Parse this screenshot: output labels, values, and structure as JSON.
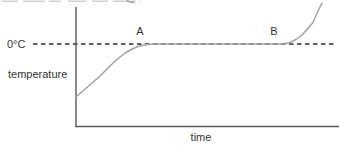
{
  "figure": {
    "labels": {
      "zero_celsius": "0°C",
      "y_axis": "temperature",
      "x_axis": "time"
    },
    "colors": {
      "curve": "#a2a2a2",
      "axis": "#5a5a5a",
      "dashed_line": "#2e2e2e",
      "text": "#333333",
      "cropped_text_remnant": "#cfcfcf"
    }
  },
  "chart_data": {
    "type": "line",
    "title": "",
    "xlabel": "time",
    "ylabel": "temperature",
    "axis_numeric_labels": false,
    "x_range_units": [
      0,
      100
    ],
    "reference_line": {
      "label": "0°C",
      "y": 0,
      "style": "dashed"
    },
    "annotations": [
      {
        "label": "A",
        "x": 26,
        "y": 0
      },
      {
        "label": "B",
        "x": 81,
        "y": 0
      }
    ],
    "series": [
      {
        "name": "temperature vs time",
        "points": [
          [
            0,
            -53
          ],
          [
            3.3,
            -46
          ],
          [
            6.5,
            -39
          ],
          [
            9.8,
            -32
          ],
          [
            13,
            -24
          ],
          [
            15.5,
            -18
          ],
          [
            17.9,
            -13
          ],
          [
            20.3,
            -8.5
          ],
          [
            22.8,
            -5
          ],
          [
            25.2,
            -2.5
          ],
          [
            27.6,
            -1
          ],
          [
            30.1,
            -0.3
          ],
          [
            32.5,
            0
          ],
          [
            84.1,
            0
          ],
          [
            87,
            1.5
          ],
          [
            89.4,
            4.5
          ],
          [
            91.9,
            9
          ],
          [
            94.3,
            15.5
          ],
          [
            96.3,
            21.5
          ],
          [
            98,
            31
          ],
          [
            99.2,
            37
          ],
          [
            100,
            41
          ]
        ]
      }
    ]
  }
}
